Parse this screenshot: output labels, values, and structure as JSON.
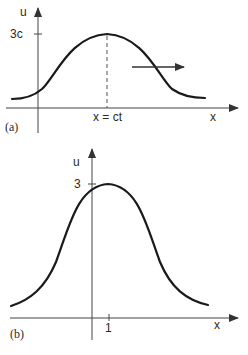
{
  "figure": {
    "panels": [
      {
        "id": "a",
        "tag": "(a)",
        "y_axis_label": "u",
        "x_axis_label": "x",
        "peak_label": "3c",
        "peak_position_label": "x = ct",
        "annotation": "arrow indicating rightward propagation of wave"
      },
      {
        "id": "b",
        "tag": "(b)",
        "y_axis_label": "u",
        "x_axis_label": "x",
        "peak_label": "3",
        "peak_position_label": "1"
      }
    ]
  },
  "colors": {
    "curve": "#1a1a1a",
    "axis": "#444444",
    "background": "#ffffff"
  }
}
